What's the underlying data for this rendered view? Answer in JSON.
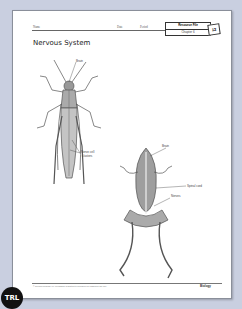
{
  "header": {
    "name_label": "Name",
    "date_label": "Date",
    "period_label": "Period",
    "resource_file_label": "Resource File",
    "chapter_label": "Chapter 6",
    "file_number": "12"
  },
  "title": "Nervous System",
  "grasshopper": {
    "labels": [
      "Brain",
      "Nerve cell",
      "clusters"
    ]
  },
  "frog": {
    "labels": [
      "Brain",
      "Spinal cord",
      "Nerves"
    ]
  },
  "footer": {
    "copyright": "© Glencoe/McGraw-Hill. Permission is granted to reproduce for classroom use only.",
    "brand": "Biology"
  },
  "badge": {
    "text": "TRL"
  },
  "colors": {
    "background": "#c9cfe0",
    "page": "#ffffff",
    "ink": "#222222"
  }
}
